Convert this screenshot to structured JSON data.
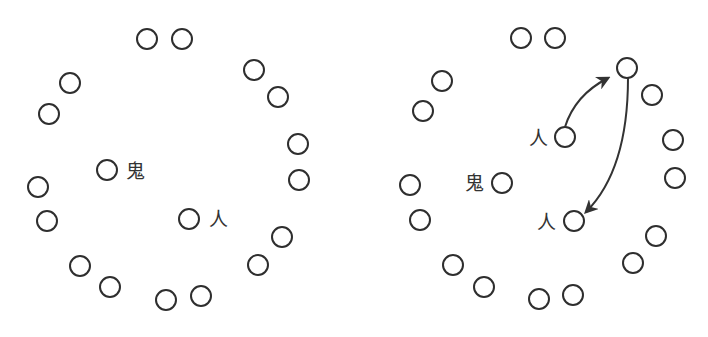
{
  "diagram": {
    "circle_radius": 10,
    "colors": {
      "stroke": "#2e2e2e",
      "text": "#333333",
      "background": "#ffffff"
    },
    "panels": [
      {
        "id": "left",
        "ring_circles": [
          [
            147,
            39
          ],
          [
            182,
            39
          ],
          [
            254,
            70
          ],
          [
            278,
            97
          ],
          [
            298,
            144
          ],
          [
            299,
            180
          ],
          [
            282,
            237
          ],
          [
            258,
            265
          ],
          [
            201,
            296
          ],
          [
            166,
            300
          ],
          [
            110,
            287
          ],
          [
            80,
            266
          ],
          [
            47,
            221
          ],
          [
            38,
            187
          ],
          [
            49,
            114
          ],
          [
            70,
            83
          ]
        ],
        "labeled_nodes": [
          {
            "role": "oni",
            "label": "鬼",
            "circle": [
              107,
              170
            ],
            "label_pos": [
              135,
              171
            ]
          },
          {
            "role": "person",
            "label": "人",
            "circle": [
              189,
              219
            ],
            "label_pos": [
              218,
              219
            ]
          }
        ],
        "arrows": []
      },
      {
        "id": "right",
        "ring_circles": [
          [
            521,
            38
          ],
          [
            555,
            38
          ],
          [
            652,
            95
          ],
          [
            673,
            140
          ],
          [
            675,
            178
          ],
          [
            656,
            236
          ],
          [
            633,
            263
          ],
          [
            573,
            295
          ],
          [
            539,
            299
          ],
          [
            484,
            287
          ],
          [
            453,
            265
          ],
          [
            420,
            220
          ],
          [
            410,
            185
          ],
          [
            423,
            111
          ],
          [
            442,
            81
          ]
        ],
        "target_circle": [
          627,
          68
        ],
        "labeled_nodes": [
          {
            "role": "oni",
            "label": "鬼",
            "circle": [
              502,
              183
            ],
            "label_pos": [
              474,
              183
            ]
          },
          {
            "role": "person-start",
            "label": "人",
            "circle": [
              565,
              137
            ],
            "label_pos": [
              538,
              138
            ]
          },
          {
            "role": "person-end",
            "label": "人",
            "circle": [
              574,
              221
            ],
            "label_pos": [
              546,
              222
            ]
          }
        ],
        "arrows": [
          {
            "from": "person-start",
            "to": "target-circle",
            "path": "M565 127 Q575 95 608 78"
          },
          {
            "from": "target-circle",
            "to": "person-end",
            "path": "M628 78 Q628 170 586 212"
          }
        ]
      }
    ]
  }
}
